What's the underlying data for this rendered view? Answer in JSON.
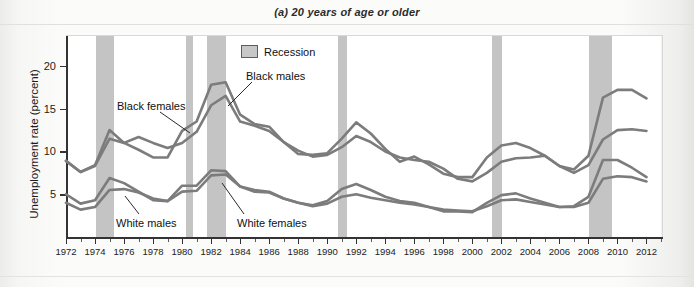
{
  "figure": {
    "title": "(a) 20 years of age or older"
  },
  "legend": {
    "recession_label": "Recession",
    "recession_color": "#c4c4c4"
  },
  "axes": {
    "ylabel": "Unemployment rate (percent)",
    "yticks": [
      5,
      10,
      15,
      20
    ],
    "ylim": [
      0,
      23.5
    ],
    "xticks": [
      1972,
      1974,
      1976,
      1978,
      1980,
      1982,
      1984,
      1986,
      1988,
      1990,
      1992,
      1994,
      1996,
      1998,
      2000,
      2002,
      2004,
      2006,
      2008,
      2010,
      2012
    ],
    "xlim": [
      1972,
      2013
    ]
  },
  "series_labels": {
    "black_females": "Black females",
    "black_males": "Black males",
    "white_males": "White males",
    "white_females": "White females"
  },
  "chart_data": {
    "type": "line",
    "title": "(a) 20 years of age or older",
    "xlabel": "",
    "ylabel": "Unemployment rate (percent)",
    "xlim": [
      1972,
      2013
    ],
    "ylim": [
      0,
      23.5
    ],
    "grid": false,
    "legend_position": "inside-top-center",
    "line_color": "#7c7c7c",
    "x": [
      1972,
      1973,
      1974,
      1975,
      1976,
      1977,
      1978,
      1979,
      1980,
      1981,
      1982,
      1983,
      1984,
      1985,
      1986,
      1987,
      1988,
      1989,
      1990,
      1991,
      1992,
      1993,
      1994,
      1995,
      1996,
      1997,
      1998,
      1999,
      2000,
      2001,
      2002,
      2003,
      2004,
      2005,
      2006,
      2007,
      2008,
      2009,
      2010,
      2011,
      2012
    ],
    "series": [
      {
        "name": "Black males",
        "values": [
          8.9,
          7.6,
          8.4,
          12.5,
          11.0,
          10.2,
          9.3,
          9.3,
          12.4,
          13.5,
          17.8,
          18.1,
          14.3,
          13.2,
          12.9,
          11.1,
          9.7,
          9.6,
          9.8,
          11.5,
          13.4,
          12.1,
          10.3,
          8.8,
          9.4,
          8.5,
          7.4,
          7.0,
          7.0,
          9.3,
          10.7,
          11.0,
          10.4,
          9.5,
          8.3,
          7.9,
          9.5,
          16.3,
          17.2,
          17.2,
          16.2
        ]
      },
      {
        "name": "Black females",
        "values": [
          8.9,
          7.6,
          8.3,
          11.5,
          11.0,
          11.7,
          11.0,
          10.4,
          11.0,
          12.3,
          15.4,
          16.5,
          13.5,
          13.0,
          12.4,
          11.1,
          10.1,
          9.4,
          9.6,
          10.5,
          11.8,
          11.1,
          10.0,
          9.3,
          9.0,
          8.8,
          8.0,
          6.8,
          6.5,
          7.5,
          8.8,
          9.2,
          9.3,
          9.5,
          8.3,
          7.5,
          8.4,
          11.4,
          12.5,
          12.6,
          12.4
        ]
      },
      {
        "name": "White males",
        "values": [
          5.0,
          3.9,
          4.3,
          6.9,
          6.3,
          5.3,
          4.3,
          4.2,
          6.0,
          6.0,
          7.8,
          7.7,
          5.9,
          5.3,
          5.2,
          4.5,
          4.0,
          3.7,
          4.2,
          5.6,
          6.2,
          5.5,
          4.7,
          4.2,
          4.0,
          3.5,
          3.0,
          3.0,
          2.9,
          4.0,
          4.9,
          5.1,
          4.5,
          4.0,
          3.5,
          3.6,
          4.7,
          9.0,
          9.0,
          8.1,
          7.0
        ]
      },
      {
        "name": "White females",
        "values": [
          4.0,
          3.2,
          3.5,
          5.5,
          5.6,
          5.2,
          4.5,
          4.2,
          5.3,
          5.4,
          7.2,
          7.3,
          5.9,
          5.5,
          5.3,
          4.5,
          4.0,
          3.6,
          3.9,
          4.7,
          5.0,
          4.6,
          4.3,
          4.0,
          3.8,
          3.5,
          3.2,
          3.1,
          3.0,
          3.6,
          4.3,
          4.4,
          4.1,
          3.8,
          3.5,
          3.5,
          4.0,
          6.8,
          7.1,
          7.0,
          6.5
        ]
      }
    ],
    "recessions": [
      {
        "start": 1973.9,
        "end": 1975.2
      },
      {
        "start": 1980.1,
        "end": 1980.6
      },
      {
        "start": 1981.6,
        "end": 1982.9
      },
      {
        "start": 1990.6,
        "end": 1991.2
      },
      {
        "start": 2001.2,
        "end": 2001.9
      },
      {
        "start": 2007.9,
        "end": 2009.5
      }
    ]
  }
}
